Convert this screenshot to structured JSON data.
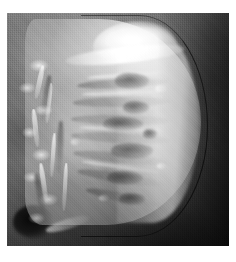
{
  "page": {
    "background_color": "#ffffff",
    "width": 236,
    "height": 262
  },
  "photo": {
    "name": "jellyfish-photograph",
    "alt_text": "Grayscale photograph of a jellyfish in profile",
    "color_mode": "grayscale",
    "frame": {
      "left": 7,
      "top": 13,
      "width": 222,
      "height": 233
    },
    "background_color": "#5a5a5a",
    "highlight_color": "#ffffff",
    "shadow_color": "#1b1b1b",
    "subject": {
      "common_name": "jellyfish",
      "orientation": "profile, bell facing right",
      "parts": [
        {
          "name": "bell",
          "description": "translucent dome occupying the right two thirds of the frame"
        },
        {
          "name": "bell-margin",
          "description": "thin dark arc tracing the outer edge of the bell"
        },
        {
          "name": "bell-highlight",
          "description": "bright specular band across the top of the bell"
        },
        {
          "name": "radial-canals",
          "description": "horizontal pale ribs fanning from the centre toward the margin"
        },
        {
          "name": "gonad-lobes",
          "description": "dark oval patches between the radial canals"
        },
        {
          "name": "oral-arms",
          "description": "frilly trailing mass on the left side of the frame"
        }
      ]
    },
    "scene": {
      "background_description": "dark mottled water with vertical tank striations",
      "dark_blob": "shadowed oval at the lower left corner",
      "bright_streak": "thin pale streak beside the lower-left blob"
    }
  }
}
